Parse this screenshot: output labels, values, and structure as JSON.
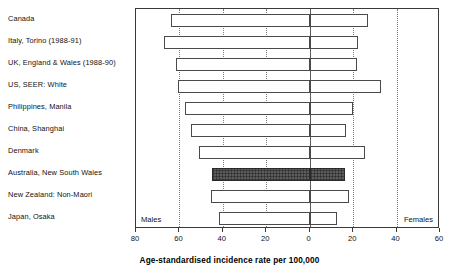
{
  "chart_data": {
    "type": "bar",
    "orientation": "horizontal",
    "subtype": "bidirectional-pyramid",
    "title": "",
    "xlabel": "Age-standardised incidence rate per 100,000",
    "ylabel": "",
    "xlim": [
      -80,
      60
    ],
    "xticks": [
      80,
      60,
      40,
      20,
      0,
      20,
      40,
      60
    ],
    "xticklabels": [
      "80",
      "60",
      "40",
      "20",
      "0",
      "20",
      "40",
      "60"
    ],
    "grid": true,
    "grid_axis": "x",
    "legend": "none",
    "side_labels": {
      "left": "Males",
      "right": "Females"
    },
    "categories": [
      "Canada",
      "Italy, Torino (1988-91)",
      "UK, England & Wales (1988-90)",
      "US, SEER: White",
      "Philippines, Manila",
      "China, Shanghai",
      "Denmark",
      "Australia, New South Wales",
      "New Zealand: Non-Maori",
      "Japan, Osaka"
    ],
    "series": [
      {
        "name": "Males",
        "direction": "left",
        "values": [
          64.0,
          67.1,
          61.8,
          60.5,
          57.4,
          54.7,
          51.2,
          45.0,
          45.5,
          41.9
        ]
      },
      {
        "name": "Females",
        "direction": "right",
        "values": [
          26.9,
          22.1,
          21.6,
          32.7,
          19.9,
          16.8,
          25.6,
          16.3,
          18.1,
          12.8
        ]
      }
    ],
    "highlighted_category": "Australia, New South Wales",
    "colors": {
      "bar_fill": "#ffffff",
      "bar_edge": "#4a4a4a",
      "highlight_fill": "#5c5c5c",
      "gridline": "#7d7d7d",
      "axis": "#3a3a3a",
      "text": "#111111"
    }
  }
}
